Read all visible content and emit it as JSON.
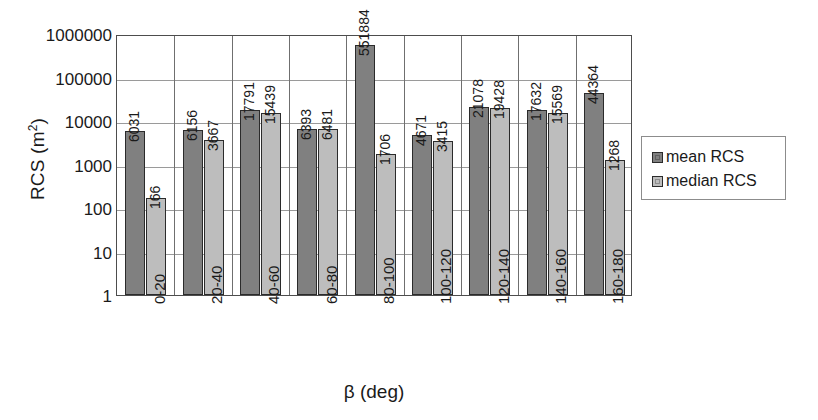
{
  "chart_data": {
    "type": "bar",
    "title": "",
    "xlabel": "β (deg)",
    "ylabel": "RCS (m²)",
    "yscale": "log",
    "ylim": [
      1,
      1000000
    ],
    "ytick_labels": [
      "1000000",
      "100000",
      "10000",
      "1000",
      "100",
      "10",
      "1"
    ],
    "ytick_values": [
      1000000,
      100000,
      10000,
      1000,
      100,
      10,
      1
    ],
    "grid": true,
    "legend_position": "right",
    "categories": [
      "0-20",
      "20-40",
      "40-60",
      "60-80",
      "80-100",
      "100-120",
      "120-140",
      "140-160",
      "160-180"
    ],
    "series": [
      {
        "name": "mean RCS",
        "color": "#808080",
        "values": [
          6031,
          6156,
          17791,
          6393,
          551884,
          4671,
          21078,
          17632,
          44364
        ],
        "labels": [
          "6031",
          "6156",
          "17791",
          "6393",
          "551884",
          "4671",
          "21078",
          "17632",
          "44364"
        ]
      },
      {
        "name": "median RCS",
        "color": "#bdbdbd",
        "values": [
          166,
          3667,
          15439,
          6481,
          1706,
          3415,
          19428,
          15569,
          1268
        ],
        "labels": [
          "166",
          "3667",
          "15439",
          "6481",
          "1706",
          "3415",
          "19428",
          "15569",
          "1268"
        ]
      }
    ]
  },
  "legend": {
    "items": [
      {
        "label": "mean RCS",
        "swatch": "mean"
      },
      {
        "label": "median RCS",
        "swatch": "median"
      }
    ]
  }
}
